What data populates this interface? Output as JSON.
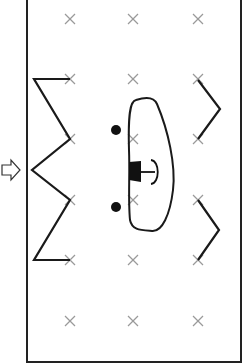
{
  "diagram": {
    "frame": {
      "x": 27,
      "y": -2,
      "width": 214,
      "height": 364,
      "stroke": "#222222"
    },
    "grid": {
      "columns": [
        70,
        133,
        198
      ],
      "rows": [
        19,
        79,
        139,
        200,
        260,
        321
      ],
      "marker": "cross",
      "color": "#999999"
    },
    "entry_arrow": {
      "x": 2,
      "y": 170,
      "direction": "right",
      "icon": "hollow-arrow-right-icon"
    },
    "zigzag_path": [
      [
        70,
        79
      ],
      [
        34,
        79
      ],
      [
        70,
        139
      ],
      [
        32,
        170
      ],
      [
        70,
        200
      ],
      [
        34,
        260
      ],
      [
        70,
        260
      ]
    ],
    "chevrons": [
      [
        [
          198,
          80
        ],
        [
          220,
          109
        ],
        [
          198,
          139
        ]
      ],
      [
        [
          198,
          200
        ],
        [
          219,
          230
        ],
        [
          198,
          260
        ]
      ]
    ],
    "dots": [
      [
        116,
        130
      ],
      [
        116,
        206
      ]
    ],
    "loop_shape": "closed-oval",
    "t_marker": {
      "x": 140,
      "y": 172
    },
    "colors": {
      "line": "#1a1a1a",
      "cross": "#9a9a9a",
      "background": "#ffffff"
    }
  }
}
